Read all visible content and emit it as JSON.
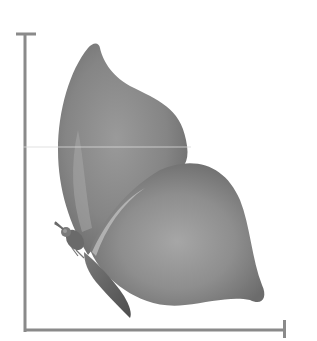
{
  "figure": {
    "style": "grayscale illustration",
    "colors": {
      "background": "#ffffff",
      "axis": "#8a8a8a",
      "wing_dark": "#6e6e6e",
      "wing_mid": "#8c8c8c",
      "wing_light": "#b4b4b4",
      "body": "#5a5a5a",
      "scan_line": "#d8d8d8"
    },
    "axes": {
      "vertical": {
        "x": 25,
        "y_top": 34,
        "y_bottom": 330,
        "top_tick": true
      },
      "horizontal": {
        "y": 330,
        "x_left": 25,
        "x_right": 284,
        "right_tick": true
      }
    }
  }
}
